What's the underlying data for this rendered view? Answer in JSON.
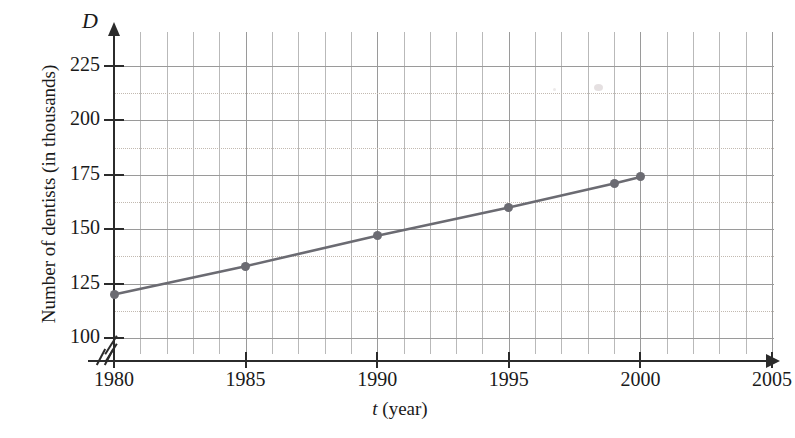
{
  "chart_data": {
    "type": "line",
    "title": "",
    "subtitle": "",
    "xlabel": "t (year)",
    "xlabel_symbol": "t",
    "xlabel_unit": "(year)",
    "ylabel": "Number of dentists (in thousands)",
    "yaxis_symbol": "D",
    "x": [
      1980,
      1985,
      1990,
      1995,
      1999,
      2000
    ],
    "values": [
      120,
      133,
      147,
      160,
      171,
      174
    ],
    "series": [
      {
        "name": "Number of dentists",
        "x": [
          1980,
          1985,
          1990,
          1995,
          1999,
          2000
        ],
        "values": [
          120,
          133,
          147,
          160,
          171,
          174
        ]
      }
    ],
    "xlim": [
      1980,
      2005
    ],
    "ylim": [
      100,
      232
    ],
    "xticks": [
      1980,
      1985,
      1990,
      1995,
      2000,
      2005
    ],
    "xtick_labels": [
      "1980",
      "1985",
      "1990",
      "1995",
      "2000",
      "2005"
    ],
    "yticks": [
      100,
      125,
      150,
      175,
      200,
      225
    ],
    "ytick_labels": [
      "100",
      "125",
      "150",
      "175",
      "200",
      "225"
    ],
    "grid": true,
    "grid_minor_x_step": 1,
    "grid_minor_y_step": 12.5,
    "legend": "none",
    "axis_break_x": true,
    "axis_break_y": true,
    "line_color": "#6b6b72",
    "marker_color": "#6b6b72",
    "marker": "circle",
    "grid_color": "#b9b9b9",
    "axis_color": "#2b2b2b"
  },
  "axes": {
    "y_axis_symbol": "D",
    "y_axis_title": "Number of dentists (in thousands)",
    "x_axis_symbol": "t",
    "x_axis_unit": "(year)"
  }
}
